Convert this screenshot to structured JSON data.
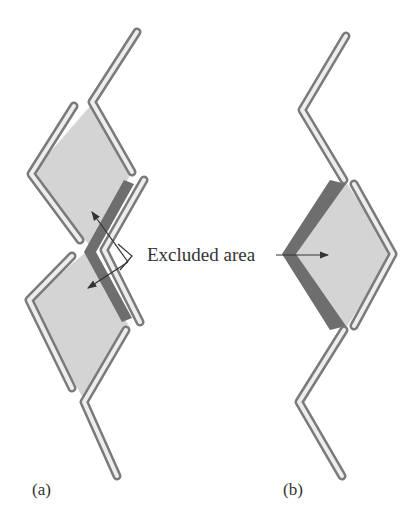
{
  "figure": {
    "annotation": "Excluded area",
    "panels": [
      {
        "id": "a",
        "label": "(a)",
        "description": "Two overlapping rhombus-shaped polymer loops with shared excluded area"
      },
      {
        "id": "b",
        "label": "(b)",
        "description": "Single rhombus-shaped loop with excluded area band"
      }
    ]
  },
  "colors": {
    "diamond_fill": "#d4d4d4",
    "excluded_band": "#6e6e6e",
    "tube_light": "#f2f2f2",
    "tube_dark": "#7a7a7a",
    "arrow": "#333333",
    "text": "#333333"
  }
}
